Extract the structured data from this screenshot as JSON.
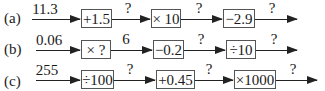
{
  "rows": [
    {
      "label": "(a)",
      "input": "11.3",
      "ops": [
        "+1.5",
        "× 10",
        "−2.9"
      ],
      "outputs": [
        "?",
        "?",
        "?"
      ]
    },
    {
      "label": "(b)",
      "input": "0.06",
      "ops": [
        "× ?",
        "−0.2",
        "÷10"
      ],
      "outputs": [
        "6",
        "?",
        "?"
      ]
    },
    {
      "label": "(c)",
      "input": "255",
      "ops": [
        "÷100",
        "+0.45",
        "×1000"
      ],
      "outputs": [
        "?",
        "?",
        "?"
      ]
    }
  ]
}
